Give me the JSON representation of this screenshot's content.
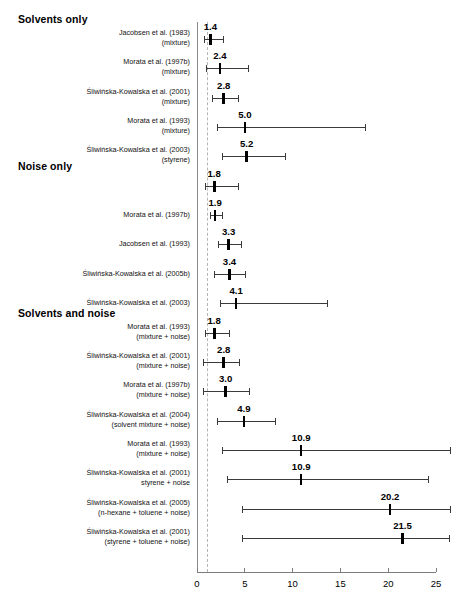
{
  "figure": {
    "type": "forest-plot",
    "x_axis": {
      "ticks": [
        0,
        5,
        10,
        15,
        20,
        25
      ],
      "tick_labels": [
        "0",
        "5",
        "10",
        "15",
        "20",
        "25"
      ],
      "range": [
        0,
        26.5
      ],
      "reference_line": 1
    },
    "sections": [
      {
        "id": "solvents-only",
        "label": "Solvents only"
      },
      {
        "id": "noise-only",
        "label": "Noise only"
      },
      {
        "id": "solvents-and-noise",
        "label": "Solvents and noise"
      }
    ]
  },
  "chart_data": {
    "type": "scatter",
    "title": "",
    "xlabel": "",
    "ylabel": "",
    "xlim": [
      0,
      26.5
    ],
    "grid": false,
    "legend": "none",
    "reference_line": 1,
    "annotations": [
      "Solvents only",
      "Noise only",
      "Solvents and noise"
    ],
    "rows": [
      {
        "section": "Solvents only",
        "section_start": true,
        "study": "Jacobsen et al. (1983)",
        "exposure": "(mixture)",
        "value": 1.4,
        "value_label": "1.4",
        "ci_low": 0.7,
        "ci_high": 2.7
      },
      {
        "section": "Solvents only",
        "section_start": false,
        "study": "Morata et al. (1997b)",
        "exposure": "(mixture)",
        "value": 2.4,
        "value_label": "2.4",
        "ci_low": 0.9,
        "ci_high": 5.3
      },
      {
        "section": "Solvents only",
        "section_start": false,
        "study": "Śliwińska-Kowalska et al. (2001)",
        "exposure": "(mixture)",
        "value": 2.8,
        "value_label": "2.8",
        "ci_low": 1.6,
        "ci_high": 4.3
      },
      {
        "section": "Solvents only",
        "section_start": false,
        "study": "Morata et al. (1993)",
        "exposure": "(mixture)",
        "value": 5.0,
        "value_label": "5.0",
        "ci_low": 2.1,
        "ci_high": 17.6
      },
      {
        "section": "Solvents only",
        "section_start": false,
        "study": "Śliwińska-Kowalska et al. (2003)",
        "exposure": "(styrene)",
        "value": 5.2,
        "value_label": "5.2",
        "ci_low": 2.6,
        "ci_high": 9.2
      },
      {
        "section": "Noise only",
        "section_start": true,
        "study": "",
        "exposure": "",
        "value": 1.8,
        "value_label": "1.8",
        "ci_low": 0.8,
        "ci_high": 4.3
      },
      {
        "section": "Noise only",
        "section_start": false,
        "study": "Morata et al. (1997b)",
        "exposure": "",
        "value": 1.9,
        "value_label": "1.9",
        "ci_low": 1.4,
        "ci_high": 2.6
      },
      {
        "section": "Noise only",
        "section_start": false,
        "study": "Jacobsen et al. (1993)",
        "exposure": "",
        "value": 3.3,
        "value_label": "3.3",
        "ci_low": 2.2,
        "ci_high": 4.6
      },
      {
        "section": "Noise only",
        "section_start": false,
        "study": "Śliwińska-Kowalska et al. (2005b)",
        "exposure": "",
        "value": 3.4,
        "value_label": "3.4",
        "ci_low": 1.8,
        "ci_high": 5.0
      },
      {
        "section": "Noise only",
        "section_start": false,
        "study": "Śliwińska-Kowalska et al. (2003)",
        "exposure": "",
        "value": 4.1,
        "value_label": "4.1",
        "ci_low": 2.4,
        "ci_high": 13.6
      },
      {
        "section": "Solvents and noise",
        "section_start": true,
        "study": "Morata et al. (1993)",
        "exposure": "(mixture + noise)",
        "value": 1.8,
        "value_label": "1.8",
        "ci_low": 0.8,
        "ci_high": 3.3
      },
      {
        "section": "Solvents and noise",
        "section_start": false,
        "study": "Śliwińska-Kowalska et al. (2001)",
        "exposure": "(mixture + noise)",
        "value": 2.8,
        "value_label": "2.8",
        "ci_low": 0.6,
        "ci_high": 4.4
      },
      {
        "section": "Solvents and noise",
        "section_start": false,
        "study": "Morata et al. (1997b)",
        "exposure": "(mixture + noise)",
        "value": 3.0,
        "value_label": "3.0",
        "ci_low": 0.6,
        "ci_high": 5.4
      },
      {
        "section": "Solvents and noise",
        "section_start": false,
        "study": "Śliwińska-Kowalska et al. (2004)",
        "exposure": "(solvent mixture + noise)",
        "value": 4.9,
        "value_label": "4.9",
        "ci_low": 2.1,
        "ci_high": 8.2
      },
      {
        "section": "Solvents and noise",
        "section_start": false,
        "study": "Morata et al. (1993)",
        "exposure": "(mixture + noise)",
        "value": 10.9,
        "value_label": "10.9",
        "ci_low": 2.6,
        "ci_high": 26.5
      },
      {
        "section": "Solvents and noise",
        "section_start": false,
        "study": "Śliwińska-Kowalska et al. (2001)",
        "exposure": "styrene + noise",
        "value": 10.9,
        "value_label": "10.9",
        "ci_low": 3.1,
        "ci_high": 24.2
      },
      {
        "section": "Solvents and noise",
        "section_start": false,
        "study": "Śliwińska-Kowalska et al. (2005)",
        "exposure": "(n-hexane + toluene + noise)",
        "value": 20.2,
        "value_label": "20.2",
        "ci_low": 4.7,
        "ci_high": 26.5
      },
      {
        "section": "Solvents and noise",
        "section_start": false,
        "study": "Śliwińska-Kowalska et al. (2001)",
        "exposure": "(styrene + toluene + noise)",
        "value": 21.5,
        "value_label": "21.5",
        "ci_low": 4.7,
        "ci_high": 26.4
      }
    ]
  }
}
